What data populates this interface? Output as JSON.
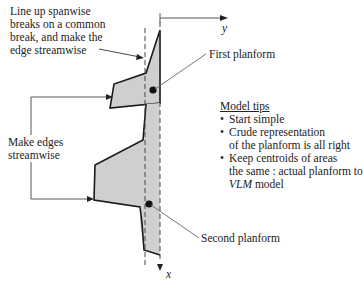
{
  "annotations": {
    "line_up": "Line up spanwise\nbreaks on a common\nbreak, and make the\nedge streamwise",
    "make_edges": "Make edges\nstreamwise",
    "first_planform": "First planform",
    "second_planform": "Second planform"
  },
  "axes": {
    "y_label": "y",
    "x_label": "x"
  },
  "model_tips": {
    "title": "Model tips",
    "items": [
      "Start simple",
      "Crude representation\nof the planform is all right",
      "Keep centroids of areas\nthe same : actual planform to"
    ],
    "last_line_italic": "VLM",
    "last_line_rest": " model"
  },
  "colors": {
    "fill": "#cfcfcf",
    "stroke": "#1a1a1a",
    "leader": "#555555"
  }
}
